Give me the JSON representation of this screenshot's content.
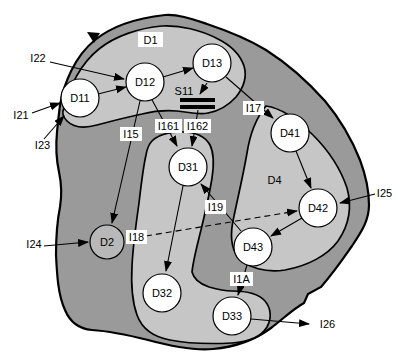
{
  "figure_type": "domain-interface-diagram",
  "colors": {
    "background": "#ffffff",
    "outer_region_fill": "#9a9a9a",
    "subregion_fill": "#c6c6c6",
    "node_fill": "#ffffff",
    "d2_node_fill": "#b8b8b8",
    "outline": "#000000",
    "label_box_fill": "#ffffff",
    "text_color": "#000000"
  },
  "regions": [
    {
      "id": "outer",
      "label": "",
      "boxed": false
    },
    {
      "id": "D1",
      "label": "D1",
      "boxed": true
    },
    {
      "id": "D3-group",
      "label": "",
      "boxed": false
    },
    {
      "id": "D4",
      "label": "D4",
      "boxed": false
    }
  ],
  "nodes": [
    {
      "id": "D11",
      "label": "D11",
      "region": "D1",
      "fill": "white"
    },
    {
      "id": "D12",
      "label": "D12",
      "region": "D1",
      "fill": "white"
    },
    {
      "id": "D13",
      "label": "D13",
      "region": "D1",
      "fill": "white"
    },
    {
      "id": "D2",
      "label": "D2",
      "region": "outer",
      "fill": "gray"
    },
    {
      "id": "D31",
      "label": "D31",
      "region": "D3-group",
      "fill": "white"
    },
    {
      "id": "D32",
      "label": "D32",
      "region": "D3-group",
      "fill": "white"
    },
    {
      "id": "D33",
      "label": "D33",
      "region": "D3-group",
      "fill": "white"
    },
    {
      "id": "D41",
      "label": "D41",
      "region": "D4",
      "fill": "white"
    },
    {
      "id": "D42",
      "label": "D42",
      "region": "D4",
      "fill": "white"
    },
    {
      "id": "D43",
      "label": "D43",
      "region": "D4",
      "fill": "white"
    }
  ],
  "service": {
    "id": "S11",
    "label": "S11",
    "symbol": "double-bar"
  },
  "interface_labels": [
    {
      "id": "I15",
      "label": "I15"
    },
    {
      "id": "I161",
      "label": "I161"
    },
    {
      "id": "I162",
      "label": "I162"
    },
    {
      "id": "I17",
      "label": "I17"
    },
    {
      "id": "I18",
      "label": "I18"
    },
    {
      "id": "I19",
      "label": "I19"
    },
    {
      "id": "I1A",
      "label": "I1A"
    }
  ],
  "external_labels": [
    {
      "id": "I21",
      "label": "I21"
    },
    {
      "id": "I22",
      "label": "I22"
    },
    {
      "id": "I23",
      "label": "I23"
    },
    {
      "id": "I24",
      "label": "I24"
    },
    {
      "id": "I25",
      "label": "I25"
    },
    {
      "id": "I26",
      "label": "I26"
    }
  ],
  "edges": [
    {
      "from": "external",
      "to": "D12",
      "label": "I22",
      "style": "solid"
    },
    {
      "from": "external",
      "to": "D11",
      "label": "I21",
      "style": "solid"
    },
    {
      "from": "external",
      "to": "D11",
      "label": "I23",
      "style": "solid"
    },
    {
      "from": "D11",
      "to": "D12",
      "label": "",
      "style": "solid"
    },
    {
      "from": "D12",
      "to": "D13",
      "label": "",
      "style": "solid"
    },
    {
      "from": "D12",
      "to": "D2",
      "label": "I15",
      "style": "solid"
    },
    {
      "from": "D12",
      "to": "D31",
      "label": "I161",
      "style": "solid"
    },
    {
      "from": "D13",
      "to": "S11",
      "label": "",
      "style": "solid"
    },
    {
      "from": "S11",
      "to": "D31",
      "label": "I162",
      "style": "solid"
    },
    {
      "from": "D13",
      "to": "D41",
      "label": "I17",
      "style": "solid"
    },
    {
      "from": "D41",
      "to": "D42",
      "label": "",
      "style": "solid"
    },
    {
      "from": "D42",
      "to": "D43",
      "label": "",
      "style": "solid"
    },
    {
      "from": "D43",
      "to": "D31",
      "label": "I19",
      "style": "solid"
    },
    {
      "from": "D2",
      "to": "D42",
      "label": "I18",
      "style": "dashed"
    },
    {
      "from": "external",
      "to": "D42",
      "label": "I25",
      "style": "solid"
    },
    {
      "from": "external",
      "to": "D2",
      "label": "I24",
      "style": "solid"
    },
    {
      "from": "D43",
      "to": "D33",
      "label": "I1A",
      "style": "solid"
    },
    {
      "from": "D33",
      "to": "external",
      "label": "I26",
      "style": "solid"
    },
    {
      "from": "D31",
      "to": "D32",
      "label": "",
      "style": "solid"
    }
  ],
  "decorations": [
    {
      "id": "boundary-arrowhead",
      "desc": "small arrowhead on outer boundary, top-left"
    }
  ]
}
